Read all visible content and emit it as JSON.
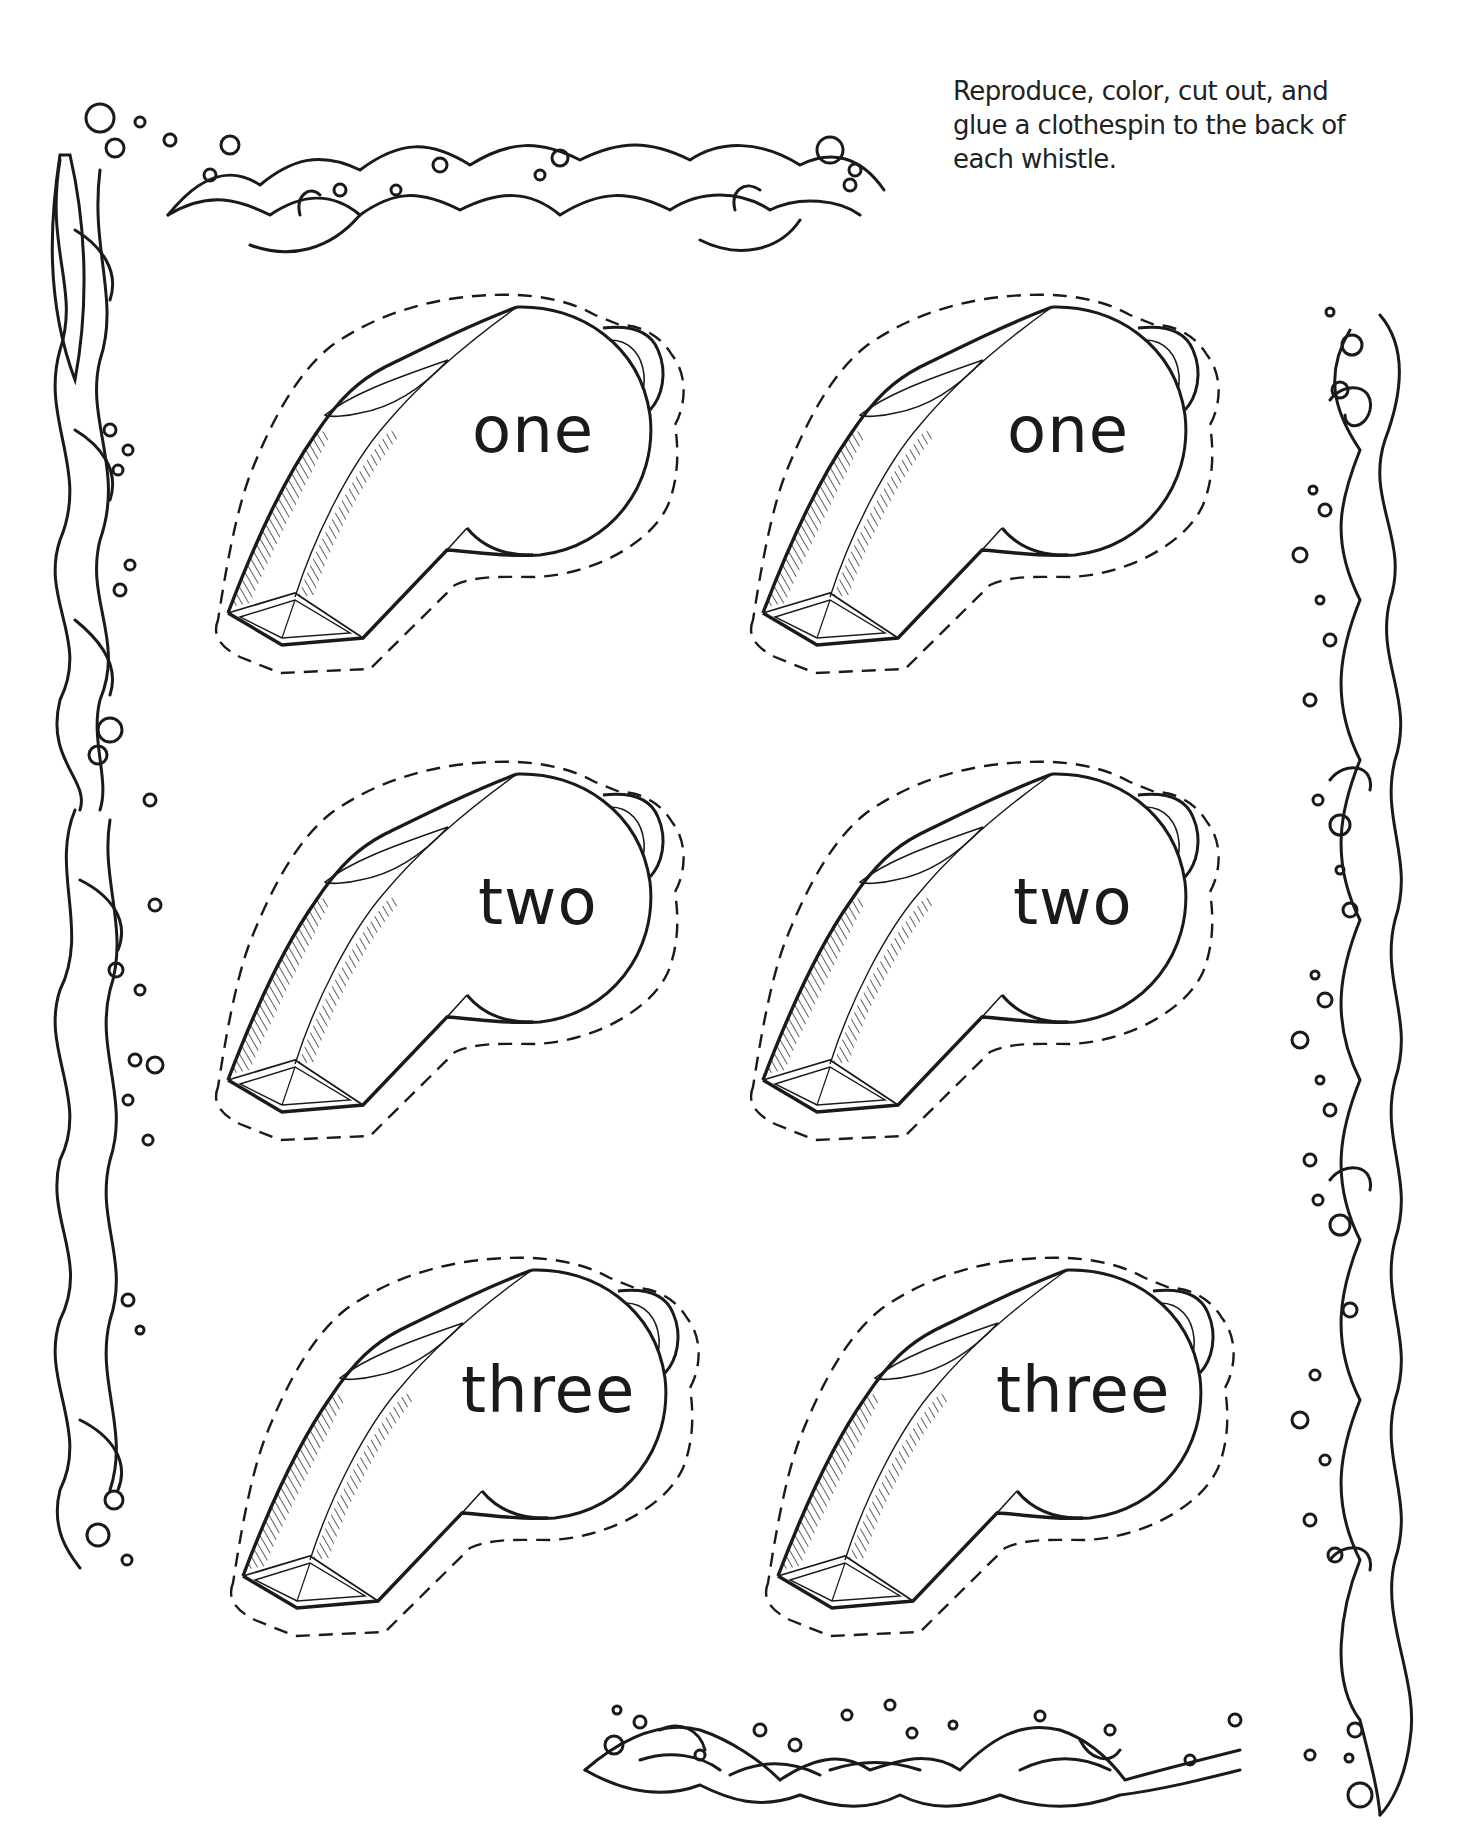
{
  "instructions": {
    "lines": [
      "Reproduce, color, cut out, and",
      "glue a clothespin to the back of",
      "each whistle."
    ]
  },
  "whistles": [
    {
      "label": "one",
      "row": 1,
      "column": "left"
    },
    {
      "label": "one",
      "row": 1,
      "column": "right"
    },
    {
      "label": "two",
      "row": 2,
      "column": "left"
    },
    {
      "label": "two",
      "row": 2,
      "column": "right"
    },
    {
      "label": "three",
      "row": 3,
      "column": "left"
    },
    {
      "label": "three",
      "row": 3,
      "column": "right"
    }
  ],
  "decorations": {
    "border_style": "water-waves-and-bubbles",
    "cut_line_style": "dashed",
    "ink_color": "#1a1a1a",
    "paper_color": "#ffffff"
  }
}
